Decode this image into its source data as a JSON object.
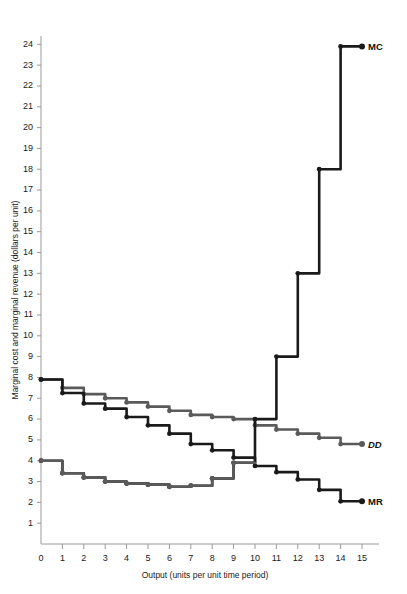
{
  "chart_data": {
    "type": "line",
    "title": "",
    "xlabel": "Output (units per unit time period)",
    "ylabel": "Marginal cost and marginal revenue (dollars per unit)",
    "xlim": [
      0,
      15.8
    ],
    "ylim": [
      0,
      24.6
    ],
    "xticks": [
      "0",
      "1",
      "2",
      "3",
      "4",
      "5",
      "6",
      "7",
      "8",
      "9",
      "10",
      "11",
      "12",
      "13",
      "14",
      "15"
    ],
    "yticks": [
      "1",
      "2",
      "3",
      "4",
      "5",
      "6",
      "7",
      "8",
      "9",
      "10",
      "11",
      "12",
      "13",
      "14",
      "15",
      "16",
      "17",
      "18",
      "19",
      "20",
      "21",
      "22",
      "23",
      "24"
    ],
    "grid": false,
    "legend_position": "inline-right-end",
    "style": "step",
    "series": [
      {
        "name": "DD",
        "label": "DD",
        "color": "#5a5a5a",
        "x": [
          0,
          1,
          2,
          3,
          4,
          5,
          6,
          7,
          8,
          9,
          10,
          11,
          12,
          13,
          14,
          15
        ],
        "values": [
          7.9,
          7.9,
          7.5,
          7.2,
          7.0,
          6.8,
          6.6,
          6.4,
          6.2,
          6.1,
          6.0,
          5.7,
          5.5,
          5.3,
          5.1,
          4.8
        ]
      },
      {
        "name": "MC",
        "label": "MC",
        "color": "#1a1a1a",
        "x": [
          0,
          1,
          2,
          3,
          4,
          5,
          6,
          7,
          8,
          9,
          10,
          11,
          12,
          13,
          14,
          15
        ],
        "values": [
          4.0,
          4.0,
          3.4,
          3.2,
          3.0,
          2.9,
          2.85,
          2.75,
          2.8,
          3.15,
          3.9,
          6.0,
          9.0,
          13.0,
          18.0,
          23.9
        ]
      },
      {
        "name": "MR",
        "label": "MR",
        "color": "#1a1a1a",
        "x": [
          0,
          1,
          2,
          3,
          4,
          5,
          6,
          7,
          8,
          9,
          10,
          11,
          12,
          13,
          14,
          15
        ],
        "values": [
          7.9,
          7.9,
          7.25,
          6.75,
          6.5,
          6.1,
          5.7,
          5.3,
          4.8,
          4.5,
          4.15,
          3.75,
          3.45,
          3.1,
          2.6,
          2.05
        ]
      }
    ],
    "notes": {
      "mc_gray_segment_end_x": 10,
      "mc_black_segment_start_x": 9,
      "intersection_approx": "MC crosses MR near output 10"
    }
  },
  "labels": {
    "dd": "DD",
    "mc": "MC",
    "mr": "MR"
  }
}
